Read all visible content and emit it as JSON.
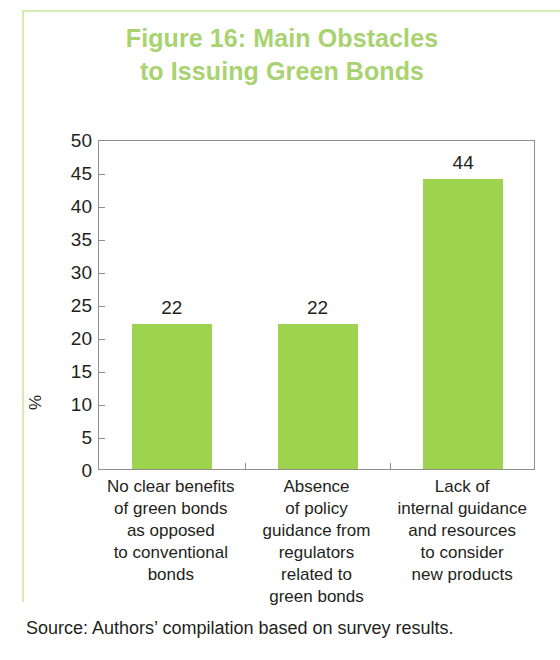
{
  "chart_data": {
    "type": "bar",
    "title": "Figure 16: Main Obstacles to Issuing Green Bonds",
    "title_lines": [
      "Figure 16: Main Obstacles",
      "to Issuing Green Bonds"
    ],
    "categories": [
      "No clear benefits of green bonds as opposed to conventional bonds",
      "Absence of policy guidance from regulators related to green bonds",
      "Lack of internal guidance and resources to consider new products"
    ],
    "category_lines": [
      [
        "No clear benefits",
        "of green bonds",
        "as opposed",
        "to conventional",
        "bonds"
      ],
      [
        "Absence",
        "of policy",
        "guidance from",
        "regulators",
        "related to",
        "green bonds"
      ],
      [
        "Lack of",
        "internal guidance",
        "and resources",
        "to consider",
        "new products"
      ]
    ],
    "values": [
      22,
      22,
      44
    ],
    "value_labels": [
      "22",
      "22",
      "44"
    ],
    "xlabel": "",
    "ylabel": "%",
    "ylim": [
      0,
      50
    ],
    "ytick_step": 5,
    "yticks": [
      "50",
      "45",
      "40",
      "35",
      "30",
      "25",
      "20",
      "15",
      "10",
      "5",
      "0"
    ],
    "grid": false,
    "legend": false,
    "bar_color": "#9ed34f",
    "title_color": "#a8d370",
    "axis_color": "#8e8e8e",
    "text_color": "#231f20"
  },
  "source": {
    "note": "Source: Authors’ compilation based on survey results."
  }
}
